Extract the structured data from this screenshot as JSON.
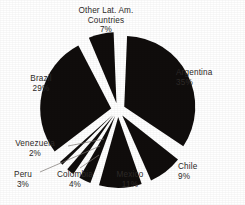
{
  "chart_data": {
    "type": "pie",
    "title": "",
    "subtitle": "",
    "xlabel": "",
    "ylabel": "",
    "legend_position": "none",
    "grid": false,
    "exploded": true,
    "units": "percent",
    "total": 100,
    "slice_color": "#100d0c",
    "background_color": "#ffffff",
    "label_color": "#2e2a28",
    "leader_line_color": "#7c7772",
    "categories": [
      "Argentina",
      "Chile",
      "Mexico",
      "Colombia",
      "Peru",
      "Venezuela",
      "Brazil",
      "Other Lat. Am. Countries"
    ],
    "values": [
      35,
      9,
      11,
      4,
      3,
      2,
      29,
      7
    ],
    "slices": [
      {
        "label": "Argentina",
        "value": 35,
        "value_text": "35%",
        "name_text": "Argentina",
        "start_deg": 0,
        "end_deg": 126
      },
      {
        "label": "Chile",
        "value": 9,
        "value_text": "9%",
        "name_text": "Chile",
        "start_deg": 126,
        "end_deg": 158.4
      },
      {
        "label": "Mexico",
        "value": 11,
        "value_text": "11%",
        "name_text": "Mexico",
        "start_deg": 158.4,
        "end_deg": 198
      },
      {
        "label": "Colombia",
        "value": 4,
        "value_text": "4%",
        "name_text": "Colombia",
        "start_deg": 198,
        "end_deg": 212.4
      },
      {
        "label": "Peru",
        "value": 3,
        "value_text": "3%",
        "name_text": "Peru",
        "start_deg": 212.4,
        "end_deg": 223.2
      },
      {
        "label": "Venezuela",
        "value": 2,
        "value_text": "2%",
        "name_text": "Venezuela",
        "start_deg": 223.2,
        "end_deg": 230.4
      },
      {
        "label": "Brazil",
        "value": 29,
        "value_text": "29%",
        "name_text": "Brazil",
        "start_deg": 230.4,
        "end_deg": 334.8
      },
      {
        "label": "Other Lat. Am. Countries",
        "value": 7,
        "value_text": "7%",
        "name_text_line1": "Other Lat. Am.",
        "name_text_line2": "Countries",
        "start_deg": 334.8,
        "end_deg": 360
      }
    ]
  },
  "labels": {
    "other": {
      "line1": "Other Lat. Am.",
      "line2": "Countries",
      "pct": "7%"
    },
    "argentina": {
      "name": "Argentina",
      "pct": "35%"
    },
    "brazil": {
      "name": "Brazil",
      "pct": "29%"
    },
    "venezuela": {
      "name": "Venezuela",
      "pct": "2%"
    },
    "peru": {
      "name": "Peru",
      "pct": "3%"
    },
    "colombia": {
      "name": "Colombia",
      "pct": "4%"
    },
    "mexico": {
      "name": "Mexico",
      "pct": "11%"
    },
    "chile": {
      "name": "Chile",
      "pct": "9%"
    }
  }
}
